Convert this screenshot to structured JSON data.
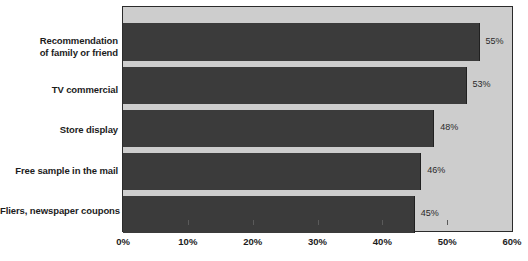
{
  "chart_data": {
    "type": "bar",
    "orientation": "horizontal",
    "title": "",
    "xlabel": "",
    "ylabel": "",
    "categories": [
      "Recommendation\nof family or friend",
      "TV commercial",
      "Store display",
      "Free sample in the mail",
      "Fliers, newspaper coupons"
    ],
    "values": [
      55,
      53,
      48,
      46,
      45
    ],
    "value_labels": [
      "55%",
      "53%",
      "48%",
      "46%",
      "45%"
    ],
    "xlim": [
      0,
      60
    ],
    "xticks": [
      0,
      10,
      20,
      30,
      40,
      50,
      60
    ],
    "xtick_labels": [
      "0%",
      "10%",
      "20%",
      "30%",
      "40%",
      "50%",
      "60%"
    ],
    "grid": false,
    "legend": false,
    "colors": {
      "bar": "#3b3b3b",
      "plot_background": "#cdcdcd",
      "page_background": "#ffffff",
      "axis": "#2b2b2b",
      "label_text": "#1c1c1c",
      "value_text": "#2a2a2a"
    }
  },
  "categories_display": [
    {
      "line1": "Recommendation",
      "line2": "of family or friend"
    },
    {
      "line1": "TV commercial",
      "line2": ""
    },
    {
      "line1": "Store display",
      "line2": ""
    },
    {
      "line1": "Free sample in the mail",
      "line2": ""
    },
    {
      "line1": "Fliers, newspaper coupons",
      "line2": ""
    }
  ]
}
